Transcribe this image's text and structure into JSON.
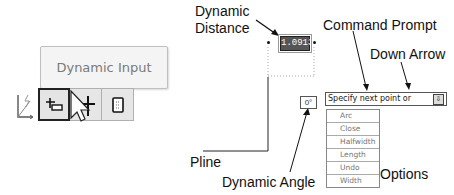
{
  "tooltip": {
    "label": "Dynamic Input"
  },
  "toolbar": {
    "buttons": [
      {
        "name": "ucs-icon",
        "active": false
      },
      {
        "name": "dynamic-input-icon",
        "active": true
      },
      {
        "name": "crosshair-icon",
        "active": false
      },
      {
        "name": "properties-icon",
        "active": false
      }
    ]
  },
  "callouts": {
    "dynamic_distance_line1": "Dynamic",
    "dynamic_distance_line2": "Distance",
    "command_prompt": "Command Prompt",
    "down_arrow": "Down Arrow",
    "pline": "Pline",
    "dynamic_angle": "Dynamic Angle",
    "options": "Options"
  },
  "dynamic_input": {
    "distance_value": "1.0913",
    "angle_value": "0°",
    "prompt_text": "Specify next point or",
    "down_arrow_glyph": "⇩",
    "options": [
      "Arc",
      "Close",
      "Halfwidth",
      "Length",
      "Undo",
      "Width"
    ]
  }
}
